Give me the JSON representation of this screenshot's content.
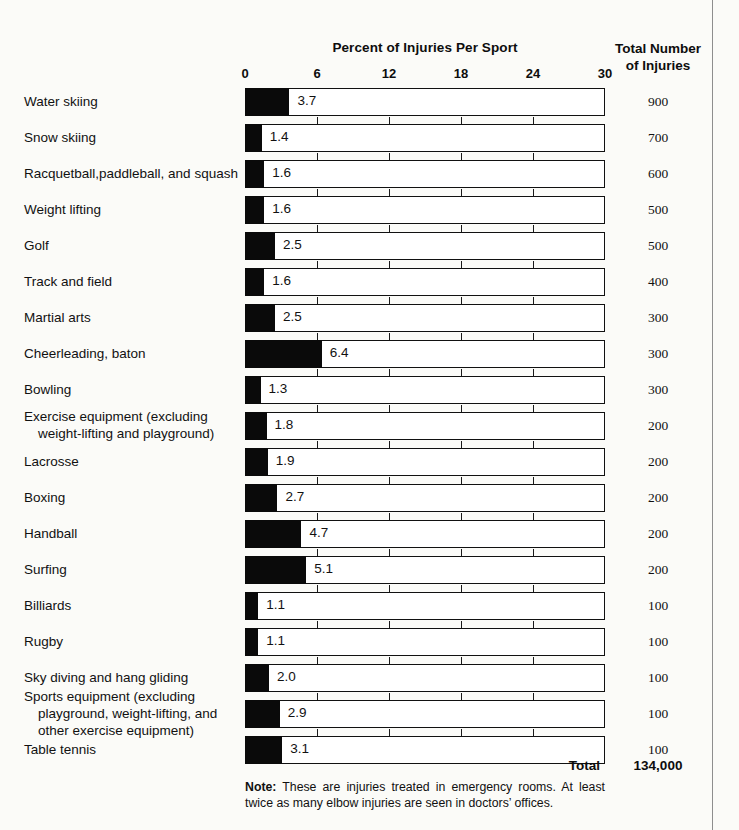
{
  "headers": {
    "chart_title": "Percent of Injuries Per Sport",
    "totals_title_line1": "Total Number",
    "totals_title_line2": "of Injuries"
  },
  "footer": {
    "total_label": "Total",
    "total_value": "134,000",
    "note_prefix": "Note:",
    "note_text": " These are injuries treated in emergency rooms. At least twice as many elbow injuries are seen in doctors’ offices."
  },
  "chart_data": {
    "type": "bar",
    "title": "Percent of Injuries Per Sport",
    "xlabel": "Percent of Injuries Per Sport",
    "ylabel": "",
    "xlim": [
      0,
      30
    ],
    "xticks": [
      0,
      6,
      12,
      18,
      24,
      30
    ],
    "xtick_labels": [
      "0",
      "6",
      "12",
      "18",
      "24",
      "30"
    ],
    "grid": false,
    "orientation": "horizontal",
    "value_column_header": "Total Number of Injuries",
    "categories": [
      "Water skiing",
      "Snow skiing",
      "Racquetball, paddleball, and squash",
      "Weight lifting",
      "Golf",
      "Track and field",
      "Martial arts",
      "Cheerleading, baton",
      "Bowling",
      "Exercise equipment (excluding weight-lifting and playground)",
      "Lacrosse",
      "Boxing",
      "Handball",
      "Surfing",
      "Billiards",
      "Rugby",
      "Sky diving and hang gliding",
      "Sports equipment (excluding playground, weight-lifting, and other exercise equipment)",
      "Table tennis"
    ],
    "values": [
      3.7,
      1.4,
      1.6,
      1.6,
      2.5,
      1.6,
      2.5,
      6.4,
      1.3,
      1.8,
      1.9,
      2.7,
      4.7,
      5.1,
      1.1,
      1.1,
      2.0,
      2.9,
      3.1
    ],
    "value_labels": [
      "3.7",
      "1.4",
      "1.6",
      "1.6",
      "2.5",
      "1.6",
      "2.5",
      "6.4",
      "1.3",
      "1.8",
      "1.9",
      "2.7",
      "4.7",
      "5.1",
      "1.1",
      "1.1",
      "2.0",
      "2.9",
      "3.1"
    ],
    "totals": [
      900,
      700,
      600,
      500,
      500,
      400,
      300,
      300,
      300,
      200,
      200,
      200,
      200,
      200,
      100,
      100,
      100,
      100,
      100
    ],
    "total_labels": [
      "900",
      "700",
      "600",
      "500",
      "500",
      "400",
      "300",
      "300",
      "300",
      "200",
      "200",
      "200",
      "200",
      "200",
      "100",
      "100",
      "100",
      "100",
      "100"
    ],
    "total_sum_label": "134,000"
  },
  "rows": [
    {
      "label_lines": [
        "Water skiing"
      ],
      "value_label": "3.7",
      "total_label": "900"
    },
    {
      "label_lines": [
        "Snow skiing"
      ],
      "value_label": "1.4",
      "total_label": "700"
    },
    {
      "label_lines": [
        "Racquetball,paddleball, and squash"
      ],
      "value_label": "1.6",
      "total_label": "600"
    },
    {
      "label_lines": [
        "Weight  lifting"
      ],
      "value_label": "1.6",
      "total_label": "500"
    },
    {
      "label_lines": [
        "Golf"
      ],
      "value_label": "2.5",
      "total_label": "500"
    },
    {
      "label_lines": [
        "Track and field"
      ],
      "value_label": "1.6",
      "total_label": "400"
    },
    {
      "label_lines": [
        "Martial arts"
      ],
      "value_label": "2.5",
      "total_label": "300"
    },
    {
      "label_lines": [
        "Cheerleading, baton"
      ],
      "value_label": "6.4",
      "total_label": "300"
    },
    {
      "label_lines": [
        "Bowling"
      ],
      "value_label": "1.3",
      "total_label": "300"
    },
    {
      "label_lines": [
        "Exercise equipment (excluding",
        "weight-lifting and playground)"
      ],
      "value_label": "1.8",
      "total_label": "200"
    },
    {
      "label_lines": [
        "Lacrosse"
      ],
      "value_label": "1.9",
      "total_label": "200"
    },
    {
      "label_lines": [
        "Boxing"
      ],
      "value_label": "2.7",
      "total_label": "200"
    },
    {
      "label_lines": [
        "Handball"
      ],
      "value_label": "4.7",
      "total_label": "200"
    },
    {
      "label_lines": [
        "Surfing"
      ],
      "value_label": "5.1",
      "total_label": "200"
    },
    {
      "label_lines": [
        "Billiards"
      ],
      "value_label": "1.1",
      "total_label": "100"
    },
    {
      "label_lines": [
        "Rugby"
      ],
      "value_label": "1.1",
      "total_label": "100"
    },
    {
      "label_lines": [
        "Sky diving and hang gliding"
      ],
      "value_label": "2.0",
      "total_label": "100"
    },
    {
      "label_lines": [
        "Sports equipment (excluding",
        "playground, weight-lifting, and",
        "other exercise equipment)"
      ],
      "value_label": "2.9",
      "total_label": "100"
    },
    {
      "label_lines": [
        "Table tennis"
      ],
      "value_label": "3.1",
      "total_label": "100"
    }
  ]
}
